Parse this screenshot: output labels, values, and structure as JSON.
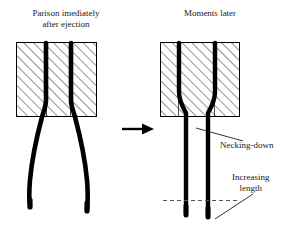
{
  "figure": {
    "title_left": "Parison imediately\nafter ejection",
    "title_right": "Moments later",
    "annotations": {
      "necking": "Necking-down",
      "increasing_length": "Increasing\nlength"
    },
    "transition_arrow": "right-arrow",
    "colors": {
      "ink": "#000000",
      "text": "#1a1a1a",
      "hatch": "#3a3a3a",
      "background": "#ffffff",
      "dashed_guide": "#555555"
    },
    "panels": [
      {
        "name": "parison-after-ejection",
        "die_block": {
          "x": 16,
          "y": 42,
          "width": 81,
          "height": 75,
          "hatch": "diagonal-45"
        },
        "parison_state": "bulging-sagging",
        "parison_walls": 2,
        "parison_bottom_y": 212
      },
      {
        "name": "parison-moments-later",
        "die_block": {
          "x": 160,
          "y": 42,
          "width": 80,
          "height": 75,
          "hatch": "diagonal-45"
        },
        "parison_state": "necked-elongated",
        "parison_walls": 2,
        "parison_bottom_y": 218,
        "guide_line_y": 200
      }
    ]
  }
}
